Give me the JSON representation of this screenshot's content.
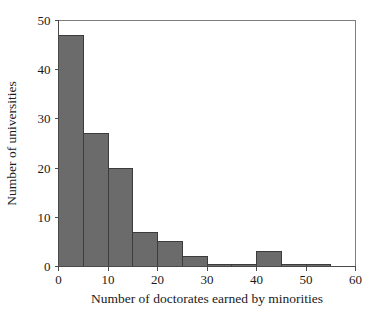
{
  "chart_data": {
    "type": "bar",
    "title": "",
    "subtitle": "",
    "xlabel": "Number of doctorates earned by minorities",
    "ylabel": "Number of universities",
    "xlim": [
      0,
      60
    ],
    "ylim": [
      0,
      50
    ],
    "xticks": [
      0,
      10,
      20,
      30,
      40,
      50,
      60
    ],
    "yticks": [
      0,
      10,
      20,
      30,
      40,
      50
    ],
    "xtick_labels": [
      "0",
      "10",
      "20",
      "30",
      "40",
      "50",
      "60"
    ],
    "ytick_labels": [
      "0",
      "10",
      "20",
      "30",
      "40",
      "50"
    ],
    "grid": false,
    "legend": null,
    "bin_width": 5,
    "bin_edges": [
      0,
      5,
      10,
      15,
      20,
      25,
      30,
      35,
      40,
      45,
      50,
      55
    ],
    "categories": [
      "0-5",
      "5-10",
      "10-15",
      "15-20",
      "20-25",
      "25-30",
      "30-35",
      "35-40",
      "40-45",
      "45-50",
      "50-55"
    ],
    "values": [
      47,
      27,
      20,
      7,
      5,
      2,
      0.5,
      0.5,
      3,
      0.5,
      0.5
    ],
    "bar_color": "#6b6b6b",
    "bar_edge_color": "#3c3c3c",
    "background_color": "#ffffff",
    "axis_color": "#4a4a4a"
  },
  "figure": {
    "name": "histogram-doctorates-minorities"
  }
}
